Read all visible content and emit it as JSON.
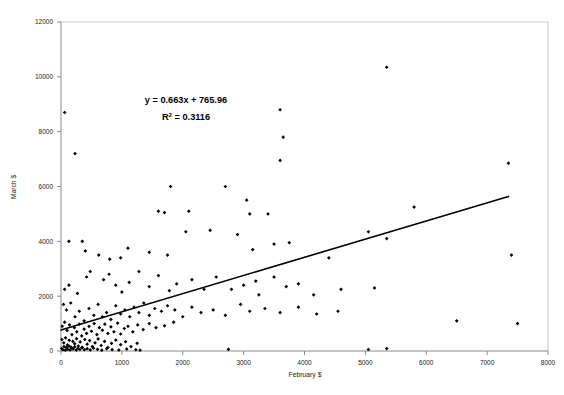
{
  "chart_data": {
    "type": "scatter",
    "title": "",
    "xlabel": "February $",
    "ylabel": "March $",
    "xlim": [
      0,
      8000
    ],
    "ylim": [
      0,
      12000
    ],
    "xticks": [
      0,
      1000,
      2000,
      3000,
      4000,
      5000,
      6000,
      7000,
      8000
    ],
    "yticks": [
      0,
      2000,
      4000,
      6000,
      8000,
      10000,
      12000
    ],
    "xtick_labels": [
      "0",
      "1000",
      "2000",
      "3000",
      "4000",
      "5000",
      "6000",
      "7000",
      "8000"
    ],
    "ytick_labels": [
      "0",
      "2000",
      "4000",
      "6000",
      "8000",
      "10000",
      "12000"
    ],
    "grid": false,
    "legend": null,
    "marker_color": "#000000",
    "marker_shape": "diamond",
    "trendline": {
      "type": "linear",
      "slope": 0.663,
      "intercept": 765.96,
      "r_squared": 0.3116,
      "equation_label": "y = 0.663x + 765.96",
      "r2_label": "R² = 0.3116",
      "color": "#000000",
      "x_start": 0,
      "x_end": 7350
    },
    "annotations": [
      {
        "text": "y = 0.663x + 765.96",
        "x": 1950,
        "y": 9000
      },
      {
        "text": "R² = 0.3116",
        "x": 1950,
        "y": 8350
      }
    ],
    "points": [
      [
        60,
        8700
      ],
      [
        230,
        7200
      ],
      [
        2700,
        6000
      ],
      [
        3050,
        5500
      ],
      [
        3400,
        5000
      ],
      [
        1800,
        6000
      ],
      [
        5350,
        10350
      ],
      [
        3600,
        8800
      ],
      [
        3650,
        7800
      ],
      [
        3600,
        6950
      ],
      [
        5800,
        5250
      ],
      [
        5350,
        4100
      ],
      [
        7350,
        6850
      ],
      [
        7400,
        3500
      ],
      [
        6500,
        1100
      ],
      [
        7500,
        1000
      ],
      [
        1600,
        5100
      ],
      [
        1700,
        5050
      ],
      [
        2100,
        5100
      ],
      [
        3100,
        5000
      ],
      [
        130,
        4000
      ],
      [
        350,
        4000
      ],
      [
        400,
        3650
      ],
      [
        620,
        3500
      ],
      [
        800,
        3350
      ],
      [
        980,
        3400
      ],
      [
        1100,
        3750
      ],
      [
        1450,
        3600
      ],
      [
        1750,
        3500
      ],
      [
        2050,
        4350
      ],
      [
        2450,
        4400
      ],
      [
        2900,
        4250
      ],
      [
        3150,
        3700
      ],
      [
        3500,
        3900
      ],
      [
        3750,
        3950
      ],
      [
        4400,
        3400
      ],
      [
        5050,
        4350
      ],
      [
        60,
        2250
      ],
      [
        130,
        2400
      ],
      [
        270,
        2100
      ],
      [
        420,
        2700
      ],
      [
        480,
        2900
      ],
      [
        700,
        2600
      ],
      [
        790,
        2800
      ],
      [
        900,
        2400
      ],
      [
        1000,
        2150
      ],
      [
        1120,
        2500
      ],
      [
        1280,
        2900
      ],
      [
        1450,
        2350
      ],
      [
        1600,
        2750
      ],
      [
        1780,
        2200
      ],
      [
        1900,
        2450
      ],
      [
        2150,
        2600
      ],
      [
        2350,
        2250
      ],
      [
        2550,
        2700
      ],
      [
        2800,
        2250
      ],
      [
        3000,
        2400
      ],
      [
        3200,
        2550
      ],
      [
        3250,
        2050
      ],
      [
        3500,
        2700
      ],
      [
        3700,
        2350
      ],
      [
        3900,
        2450
      ],
      [
        4150,
        2050
      ],
      [
        4600,
        2250
      ],
      [
        5150,
        2300
      ],
      [
        40,
        1700
      ],
      [
        90,
        1500
      ],
      [
        160,
        1750
      ],
      [
        230,
        1250
      ],
      [
        300,
        1450
      ],
      [
        380,
        1100
      ],
      [
        460,
        1550
      ],
      [
        540,
        1300
      ],
      [
        610,
        1700
      ],
      [
        680,
        1250
      ],
      [
        750,
        1400
      ],
      [
        820,
        1150
      ],
      [
        900,
        1650
      ],
      [
        980,
        1350
      ],
      [
        1050,
        1500
      ],
      [
        1130,
        1250
      ],
      [
        1200,
        1600
      ],
      [
        1280,
        1400
      ],
      [
        1360,
        1750
      ],
      [
        1450,
        1300
      ],
      [
        1540,
        1550
      ],
      [
        1650,
        1450
      ],
      [
        1750,
        1650
      ],
      [
        1870,
        1500
      ],
      [
        2000,
        1250
      ],
      [
        2150,
        1600
      ],
      [
        2300,
        1400
      ],
      [
        2500,
        1500
      ],
      [
        2700,
        1300
      ],
      [
        2950,
        1700
      ],
      [
        3100,
        1450
      ],
      [
        3350,
        1550
      ],
      [
        3600,
        1400
      ],
      [
        3900,
        1600
      ],
      [
        4200,
        1350
      ],
      [
        4550,
        1450
      ],
      [
        20,
        900
      ],
      [
        60,
        1050
      ],
      [
        100,
        750
      ],
      [
        140,
        950
      ],
      [
        180,
        600
      ],
      [
        220,
        850
      ],
      [
        260,
        700
      ],
      [
        300,
        980
      ],
      [
        340,
        550
      ],
      [
        380,
        800
      ],
      [
        420,
        640
      ],
      [
        460,
        900
      ],
      [
        500,
        720
      ],
      [
        545,
        1000
      ],
      [
        590,
        600
      ],
      [
        630,
        850
      ],
      [
        680,
        760
      ],
      [
        720,
        980
      ],
      [
        770,
        640
      ],
      [
        820,
        880
      ],
      [
        870,
        700
      ],
      [
        930,
        1020
      ],
      [
        980,
        620
      ],
      [
        1040,
        820
      ],
      [
        1100,
        900
      ],
      [
        1180,
        700
      ],
      [
        1260,
        950
      ],
      [
        1350,
        780
      ],
      [
        1450,
        1000
      ],
      [
        1560,
        850
      ],
      [
        1700,
        920
      ],
      [
        1850,
        1050
      ],
      [
        15,
        420
      ],
      [
        45,
        300
      ],
      [
        75,
        480
      ],
      [
        105,
        220
      ],
      [
        135,
        390
      ],
      [
        165,
        140
      ],
      [
        195,
        350
      ],
      [
        225,
        260
      ],
      [
        255,
        450
      ],
      [
        285,
        180
      ],
      [
        315,
        330
      ],
      [
        350,
        120
      ],
      [
        390,
        420
      ],
      [
        430,
        250
      ],
      [
        470,
        380
      ],
      [
        515,
        160
      ],
      [
        560,
        300
      ],
      [
        610,
        440
      ],
      [
        660,
        200
      ],
      [
        715,
        350
      ],
      [
        770,
        130
      ],
      [
        830,
        280
      ],
      [
        900,
        400
      ],
      [
        980,
        230
      ],
      [
        1060,
        340
      ],
      [
        1150,
        160
      ],
      [
        1250,
        280
      ],
      [
        10,
        90
      ],
      [
        30,
        50
      ],
      [
        50,
        160
      ],
      [
        70,
        30
      ],
      [
        90,
        120
      ],
      [
        110,
        60
      ],
      [
        130,
        180
      ],
      [
        150,
        40
      ],
      [
        175,
        110
      ],
      [
        200,
        70
      ],
      [
        225,
        150
      ],
      [
        250,
        35
      ],
      [
        280,
        95
      ],
      [
        310,
        55
      ],
      [
        345,
        130
      ],
      [
        385,
        45
      ],
      [
        430,
        85
      ],
      [
        480,
        40
      ],
      [
        535,
        100
      ],
      [
        600,
        60
      ],
      [
        670,
        30
      ],
      [
        750,
        80
      ],
      [
        840,
        50
      ],
      [
        950,
        35
      ],
      [
        1080,
        70
      ],
      [
        1230,
        45
      ],
      [
        1300,
        30
      ],
      [
        5050,
        55
      ],
      [
        5350,
        90
      ],
      [
        2750,
        60
      ]
    ]
  },
  "axes": {
    "x_axis_title": "February $",
    "y_axis_title": "March $"
  }
}
